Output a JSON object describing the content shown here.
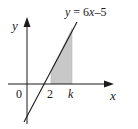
{
  "diagram": {
    "equation_label": "y = 6x–5",
    "equation_parts": {
      "y": "y",
      "eq": " = 6",
      "x": "x",
      "rest": "–5"
    },
    "axes": {
      "x_label": "x",
      "y_label": "y",
      "origin_label": "0"
    },
    "ticks": [
      {
        "label": "2",
        "italic": false
      },
      {
        "label": "k",
        "italic": true
      }
    ],
    "shaded_region": {
      "from": "2",
      "to": "k",
      "color": "#c8c8c8"
    },
    "colors": {
      "line": "#1a1a1a",
      "shade": "#c8c8c8",
      "background": "#ffffff"
    }
  }
}
